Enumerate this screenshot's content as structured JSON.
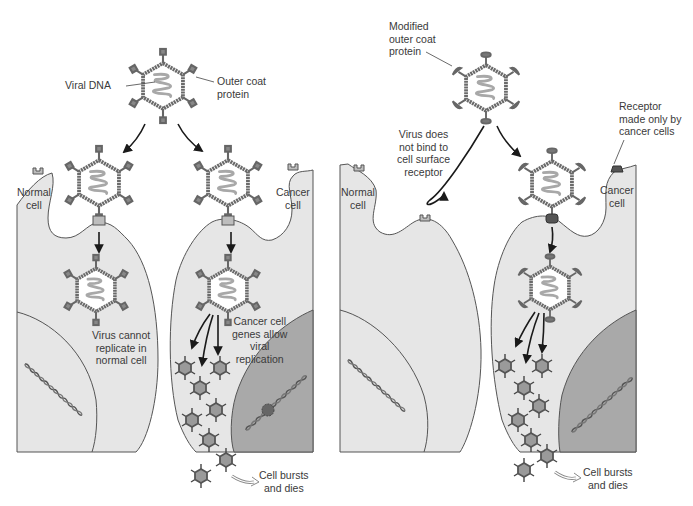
{
  "diagram": {
    "panels": [
      {
        "id": "panel-unmodified-virus",
        "labels": {
          "viral_dna": "Viral DNA",
          "outer_coat": "Outer coat\nprotein",
          "normal_cell": "Normal\ncell",
          "cancer_cell": "Cancer\ncell",
          "virus_cannot_replicate": "Virus cannot\nreplicate in\nnormal cell",
          "cancer_genes_allow": "Cancer cell\ngenes allow\nviral\nreplication",
          "cell_bursts": "Cell bursts\nand dies"
        }
      },
      {
        "id": "panel-modified-virus",
        "labels": {
          "modified_coat": "Modified\nouter coat\nprotein",
          "virus_does_not_bind": "Virus does\nnot bind to\ncell surface\nreceptor",
          "receptor_cancer_only": "Receptor\nmade only by\ncancer cells",
          "normal_cell": "Normal\ncell",
          "cancer_cell": "Cancer\ncell",
          "cell_bursts": "Cell bursts\nand dies"
        }
      }
    ],
    "colors": {
      "cell_fill": "#e6e6e6",
      "nucleus_normal": "#e0e0e0",
      "nucleus_cancer": "#a9a9a9",
      "virus_coat": "#6f6f6f",
      "viral_dna": "#a8a8a8",
      "outline": "#555555",
      "text": "#3a3a3a",
      "arrow": "#1a1a1a"
    }
  }
}
